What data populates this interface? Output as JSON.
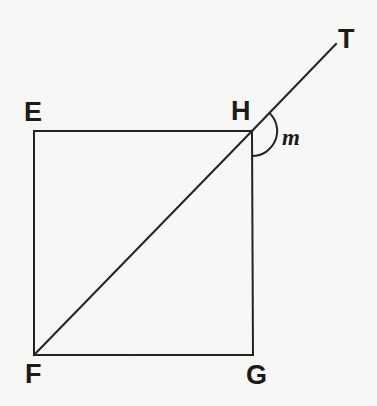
{
  "figure": {
    "type": "geometry-diagram",
    "background_color": "#f7f7f6",
    "stroke_color": "#232323",
    "stroke_width": 2,
    "labels": {
      "E": "E",
      "F": "F",
      "G": "G",
      "H": "H",
      "T": "T",
      "angle": "m"
    },
    "points": {
      "E": {
        "x": 34,
        "y": 131
      },
      "F": {
        "x": 34,
        "y": 355
      },
      "G": {
        "x": 253,
        "y": 355
      },
      "H": {
        "x": 252,
        "y": 131
      },
      "T": {
        "x": 336,
        "y": 44
      }
    },
    "segments": [
      {
        "name": "EH",
        "from": "E",
        "to": "H"
      },
      {
        "name": "EF",
        "from": "E",
        "to": "F"
      },
      {
        "name": "FG",
        "from": "F",
        "to": "G"
      },
      {
        "name": "GH",
        "from": "G",
        "to": "H"
      },
      {
        "name": "FH-diagonal",
        "from": "F",
        "to": "H"
      },
      {
        "name": "HT-ray",
        "from": "H",
        "to": "T"
      }
    ],
    "angle_arc": {
      "vertex": "H",
      "radius": 25,
      "from_ray": "HT",
      "to_ray": "HG",
      "label": "m"
    }
  }
}
